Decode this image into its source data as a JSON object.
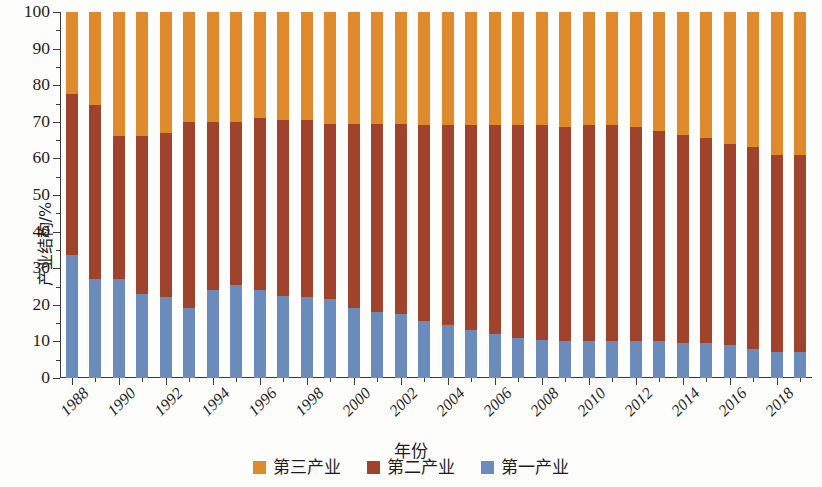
{
  "chart_data": {
    "type": "bar",
    "stacked": true,
    "title": "",
    "xlabel": "年份",
    "ylabel": "产业结构/%",
    "ylim": [
      0,
      100
    ],
    "ytick_step": 10,
    "grid": false,
    "legend_position": "bottom",
    "x": [
      1988,
      1989,
      1990,
      1991,
      1992,
      1993,
      1994,
      1995,
      1996,
      1997,
      1998,
      1999,
      2000,
      2001,
      2002,
      2003,
      2004,
      2005,
      2006,
      2007,
      2008,
      2009,
      2010,
      2011,
      2012,
      2013,
      2014,
      2015,
      2016,
      2017,
      2018,
      2019
    ],
    "xtick_labels": [
      "1988",
      "1990",
      "1992",
      "1994",
      "1996",
      "1998",
      "2000",
      "2002",
      "2004",
      "2006",
      "2008",
      "2010",
      "2012",
      "2014",
      "2016",
      "2018"
    ],
    "ytick_labels": [
      "0",
      "10",
      "20",
      "30",
      "40",
      "50",
      "60",
      "70",
      "80",
      "90",
      "100"
    ],
    "series": [
      {
        "name": "第一产业",
        "color": "#6b8cba",
        "values": [
          33.5,
          27.0,
          27.0,
          23.0,
          22.0,
          19.0,
          24.0,
          25.5,
          24.0,
          22.5,
          22.0,
          21.5,
          19.0,
          18.0,
          17.5,
          15.5,
          14.5,
          13.0,
          12.0,
          11.0,
          10.5,
          10.0,
          10.0,
          10.0,
          10.0,
          10.0,
          9.5,
          9.5,
          9.0,
          8.0,
          7.0,
          7.0
        ]
      },
      {
        "name": "第二产业",
        "color": "#a0432c",
        "values": [
          44.0,
          47.5,
          39.0,
          43.0,
          45.0,
          51.0,
          46.0,
          44.5,
          47.0,
          48.0,
          48.5,
          48.0,
          50.5,
          51.5,
          52.0,
          53.5,
          54.5,
          56.0,
          57.0,
          58.0,
          58.5,
          58.5,
          59.0,
          59.0,
          58.5,
          57.5,
          57.0,
          56.0,
          55.0,
          55.0,
          54.0,
          54.0
        ]
      },
      {
        "name": "第三产业",
        "color": "#e08a2e",
        "values": [
          22.5,
          25.5,
          34.0,
          34.0,
          33.0,
          30.0,
          30.0,
          30.0,
          29.0,
          29.5,
          29.5,
          30.5,
          30.5,
          30.5,
          30.5,
          31.0,
          31.0,
          31.0,
          31.0,
          31.0,
          31.0,
          31.5,
          31.0,
          31.0,
          31.5,
          32.5,
          33.5,
          34.5,
          36.0,
          37.0,
          39.0,
          39.0
        ]
      }
    ]
  },
  "legend": {
    "items": [
      {
        "label": "第三产业",
        "color": "#e08a2e"
      },
      {
        "label": "第二产业",
        "color": "#a0432c"
      },
      {
        "label": "第一产业",
        "color": "#6b8cba"
      }
    ]
  },
  "axes": {
    "y_title": "产业结构/%",
    "x_title": "年份"
  }
}
